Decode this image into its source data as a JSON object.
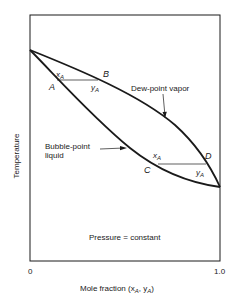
{
  "diagram": {
    "y_axis_label": "Temperature",
    "x_axis_label": "Mole fraction (x",
    "x_axis_label_sub1": "A",
    "x_axis_label_mid": ", y",
    "x_axis_label_sub2": "A",
    "x_axis_label_end": ")",
    "x_tick_min": "0",
    "x_tick_max": "1.0",
    "condition": "Pressure = constant",
    "curves": {
      "dew_point": "Dew-point vapor",
      "bubble_point_line1": "Bubble-point",
      "bubble_point_line2": "liquid"
    },
    "points": {
      "A": "A",
      "B": "B",
      "C": "C",
      "D": "D"
    },
    "tie_line_labels": {
      "x_main": "x",
      "y_main": "y",
      "sub": "A"
    },
    "colors": {
      "line": "#1a1a1a",
      "background": "#ffffff"
    }
  }
}
